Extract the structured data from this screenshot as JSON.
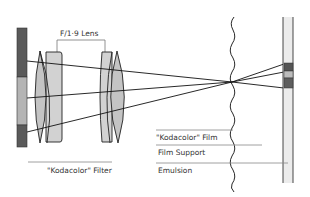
{
  "diagram": {
    "labels": {
      "lens": "F/1·9 Lens",
      "filter": "\"Kodacolor\" Filter",
      "film": "\"Kodacolor\" Film",
      "film_support": "Film Support",
      "emulsion": "Emulsion"
    },
    "colors": {
      "dark_filter": "#5a5a5a",
      "light_filter": "#b4b4b4",
      "lens_fill": "#c8c8c8",
      "outline": "#222222",
      "leader_line": "#888888",
      "film_base": "#ececec"
    }
  }
}
